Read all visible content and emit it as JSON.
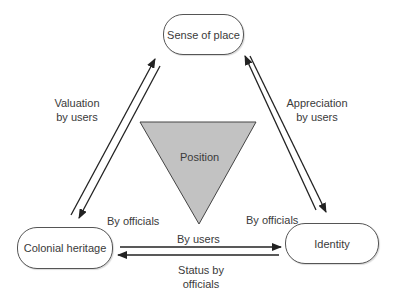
{
  "nodes": {
    "top": "Sense of place",
    "left": "Colonial heritage",
    "right": "Identity"
  },
  "center": {
    "label": "Position",
    "fill": "#c2c2c2"
  },
  "edges": {
    "left_pair": {
      "label_line1": "Valuation",
      "label_line2": "by users",
      "bottom_label": "By officials"
    },
    "right_pair": {
      "label_line1": "Appreciation",
      "label_line2": "by users",
      "bottom_label": "By officials"
    },
    "bottom_pair": {
      "top_label": "By users",
      "bottom_label_line1": "Status by",
      "bottom_label_line2": "officials"
    }
  },
  "colors": {
    "stroke": "#222222",
    "node_border": "#555555",
    "text": "#3a3a3a"
  }
}
